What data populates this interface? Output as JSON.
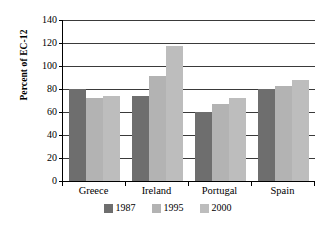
{
  "chart_data": {
    "type": "bar",
    "title": "",
    "xlabel": "",
    "ylabel": "Percent of EC-12",
    "categories": [
      "Greece",
      "Ireland",
      "Portugal",
      "Spain"
    ],
    "series": [
      {
        "name": "1987",
        "color": "#6e6e6e",
        "values": [
          80,
          74,
          60,
          80
        ]
      },
      {
        "name": "1995",
        "color": "#b3b3b3",
        "values": [
          72,
          91,
          67,
          83
        ]
      },
      {
        "name": "2000",
        "color": "#bdbdbd",
        "values": [
          74,
          117,
          72,
          88
        ]
      }
    ],
    "ylim": [
      0,
      140
    ],
    "yticks": [
      0,
      20,
      40,
      60,
      80,
      100,
      120,
      140
    ],
    "ytick_labels": [
      "0",
      "20",
      "40",
      "60",
      "80",
      "100",
      "120",
      "140"
    ],
    "grid": true,
    "legend_position": "bottom"
  }
}
